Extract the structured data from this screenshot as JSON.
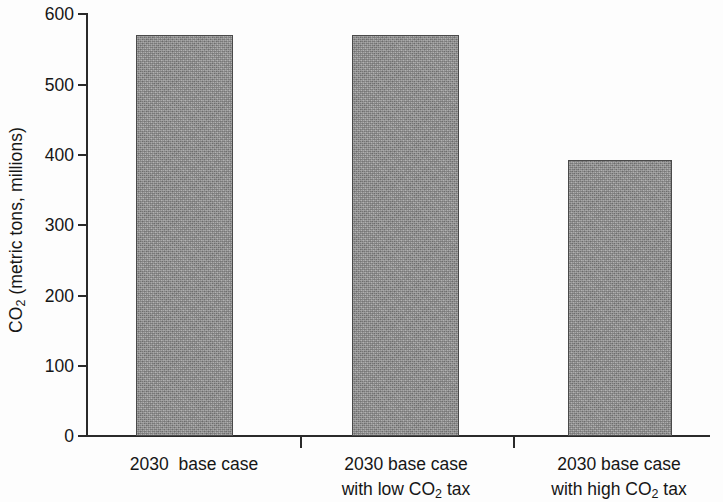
{
  "chart_data": {
    "type": "bar",
    "title": "",
    "xlabel": "",
    "ylabel": "CO2 (metric tons, millions)",
    "ylabel_parts": {
      "prefix": "CO",
      "sub": "2",
      "suffix": " (metric tons, millions)"
    },
    "categories": [
      "2030  base case",
      "2030 base case with low CO2 tax",
      "2030 base case with high CO2 tax"
    ],
    "category_lines": [
      [
        "2030  base case"
      ],
      [
        "2030 base case",
        "with low CO2 tax"
      ],
      [
        "2030 base case",
        "with high CO2 tax"
      ]
    ],
    "values": [
      570,
      570,
      392
    ],
    "ylim": [
      0,
      600
    ],
    "yticks": [
      0,
      100,
      200,
      300,
      400,
      500,
      600
    ],
    "ytick_labels": [
      "0",
      "100",
      "200",
      "300",
      "400",
      "500",
      "600"
    ],
    "grid": false,
    "legend": null,
    "bar_color": "#909090",
    "bar_edge_color": "#4a4a4a",
    "axis_color": "#2a2a2a"
  },
  "labels": {
    "cat1_line1_a": "2030",
    "cat1_line1_b": "base case",
    "cat2_line1": "2030 base case",
    "cat2_line2_a": "with low CO",
    "cat2_line2_sub": "2",
    "cat2_line2_b": " tax",
    "cat3_line1": "2030 base case",
    "cat3_line2_a": "with high CO",
    "cat3_line2_sub": "2",
    "cat3_line2_b": " tax"
  },
  "yaxis": {
    "t0": "0",
    "t1": "100",
    "t2": "200",
    "t3": "300",
    "t4": "400",
    "t5": "500",
    "t6": "600",
    "title_prefix": "CO",
    "title_sub": "2",
    "title_suffix": " (metric tons, millions)"
  }
}
